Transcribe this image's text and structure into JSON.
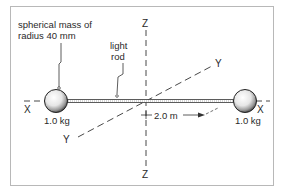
{
  "figure": {
    "labels": {
      "sphere_annotation_line1": "spherical mass of",
      "sphere_annotation_line2": "radius 40 mm",
      "rod_annotation_line1": "light",
      "rod_annotation_line2": "rod",
      "left_mass": "1.0 kg",
      "right_mass": "1.0 kg",
      "distance": "2.0 m"
    },
    "axes": {
      "x_left": "X",
      "x_right": "X",
      "y_top": "Y",
      "y_bottom": "Y",
      "z_top": "Z",
      "z_bottom": "Z"
    },
    "colors": {
      "frame": "#b8b8b8",
      "line": "#333333",
      "text": "#2a2a2a"
    }
  }
}
